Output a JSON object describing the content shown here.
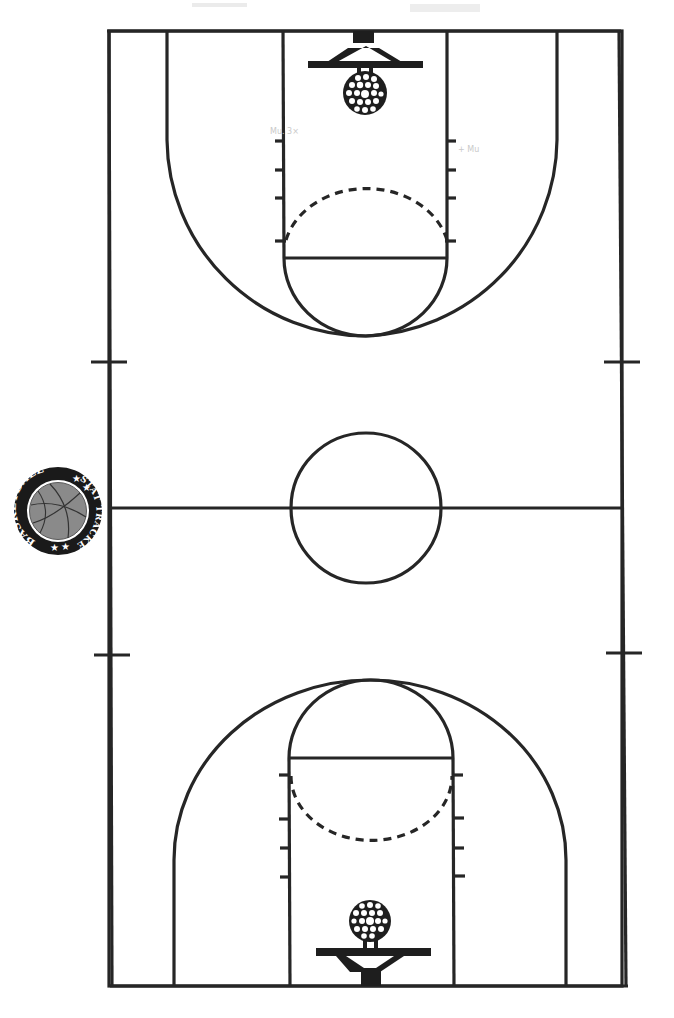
{
  "diagram": {
    "type": "basketball-court",
    "orientation": "vertical",
    "line_color": "#262626",
    "background": "#ffffff"
  },
  "logo": {
    "top_text": "BASKETBALL",
    "side_text": "STAT TRACKER",
    "bottom_text": "BASKETBALL",
    "stars": "★ ★",
    "ball_color": "#8a8a8a",
    "ring_color": "#1a1a1a"
  },
  "court": {
    "features": [
      "sideline-left",
      "sideline-right",
      "baseline-top",
      "baseline-bottom",
      "half-court-line",
      "center-circle",
      "top-key",
      "top-free-throw-circle",
      "top-three-point-arc",
      "top-basket",
      "bottom-key",
      "bottom-free-throw-circle",
      "bottom-three-point-arc",
      "bottom-basket",
      "coaching-box-ticks"
    ]
  }
}
